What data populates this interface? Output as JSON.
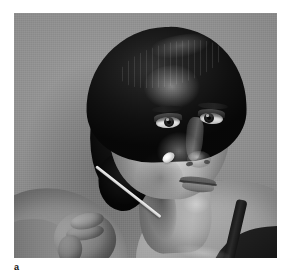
{
  "figure": {
    "label": "a",
    "kind": "photograph",
    "color_mode": "grayscale",
    "alt_description": "Black-and-white clinical photograph of a woman with short dark hair pulled back, facing slightly to her left, while a cotton-tipped applicator held in a hand from the lower left touches her left cheek.",
    "subject": {
      "hair": "short dark hair brushed back",
      "pose": "head turned three-quarter toward viewer's right",
      "garment": "dark strap top over bare shoulder"
    },
    "instrument": {
      "name": "cotton-tipped applicator",
      "tip_location": "left cheek",
      "held_by": "hand entering from lower left"
    },
    "colors": {
      "page_background": "#ffffff",
      "photo_backdrop": "#8d8d8d",
      "hair": "#141210",
      "skin_highlight": "#d7c5b0",
      "skin_shadow": "#8d7a66",
      "swab": "#f4f1ea",
      "garment": "#17150f",
      "caption_text": "#111111"
    },
    "geometry": {
      "page_width_px": 289,
      "page_height_px": 277,
      "photo_x_px": 14,
      "photo_y_px": 13,
      "photo_width_px": 263,
      "photo_height_px": 245
    }
  }
}
